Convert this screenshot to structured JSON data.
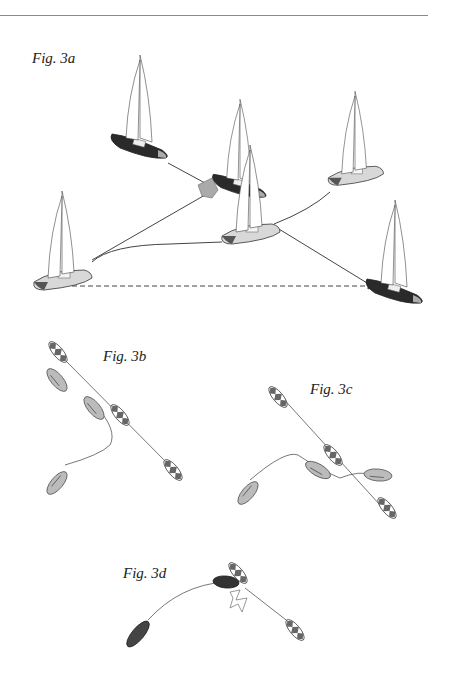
{
  "page": {
    "top_rule": true
  },
  "figures": [
    {
      "id": "fig-3a",
      "caption": "Fig. 3a"
    },
    {
      "id": "fig-3b",
      "caption": "Fig. 3b"
    },
    {
      "id": "fig-3c",
      "caption": "Fig. 3c"
    },
    {
      "id": "fig-3d",
      "caption": "Fig. 3d"
    }
  ],
  "colors": {
    "hull_light": "#d8d8d8",
    "hull_dark": "#2a2a2a",
    "hull_mid": "#8c8c8c",
    "track_line": "#444444",
    "sail": "#ffffff"
  }
}
